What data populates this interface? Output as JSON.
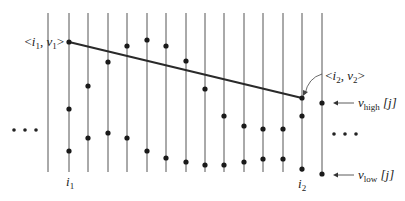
{
  "diagram": {
    "labels": {
      "start_point": "⟨i₁, v₁⟩",
      "end_point": "⟨i₂, v₂⟩",
      "i1": "i",
      "i1_sub": "1",
      "i2": "i",
      "i2_sub": "2",
      "v_high": "v",
      "v_high_sub": "high",
      "v_high_idx": "[j]",
      "v_low": "v",
      "v_low_sub": "low",
      "v_low_idx": "[j]",
      "left_ellipsis": "• • •",
      "right_ellipsis": "• • •"
    },
    "colors": {
      "line": "#2a2a2a",
      "column": "#555555",
      "dot": "#1a1a1a"
    },
    "columns": [
      {
        "x": 48,
        "dots": []
      },
      {
        "x": 69,
        "dots": [
          42,
          109,
          151
        ],
        "label": "i1"
      },
      {
        "x": 88,
        "dots": [
          86,
          138
        ]
      },
      {
        "x": 108,
        "dots": [
          62,
          133
        ]
      },
      {
        "x": 127,
        "dots": [
          46,
          138
        ]
      },
      {
        "x": 147,
        "dots": [
          40,
          151
        ]
      },
      {
        "x": 166,
        "dots": [
          46,
          158
        ]
      },
      {
        "x": 186,
        "dots": [
          61,
          162
        ]
      },
      {
        "x": 205,
        "dots": [
          89,
          165
        ]
      },
      {
        "x": 224,
        "dots": [
          116,
          165
        ]
      },
      {
        "x": 244,
        "dots": [
          126,
          162
        ]
      },
      {
        "x": 263,
        "dots": [
          129,
          159
        ]
      },
      {
        "x": 283,
        "dots": [
          129,
          159
        ]
      },
      {
        "x": 302,
        "dots": [
          98,
          116,
          169
        ],
        "label": "i2"
      },
      {
        "x": 322,
        "dots": [
          103,
          174
        ]
      }
    ],
    "segment": {
      "x1": 69,
      "y1": 42,
      "x2": 302,
      "y2": 98
    }
  }
}
